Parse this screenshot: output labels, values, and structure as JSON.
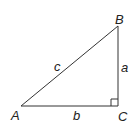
{
  "diagram": {
    "vertices": [
      {
        "name": "A",
        "x": 21,
        "y": 106
      },
      {
        "name": "B",
        "x": 118,
        "y": 26
      },
      {
        "name": "C",
        "x": 118,
        "y": 106
      }
    ],
    "labels": {
      "vertex_a": "A",
      "vertex_b": "B",
      "vertex_c": "C",
      "side_a": "a",
      "side_b": "b",
      "side_c": "c"
    },
    "right_angle_at": "C",
    "line_color": "#333333"
  }
}
